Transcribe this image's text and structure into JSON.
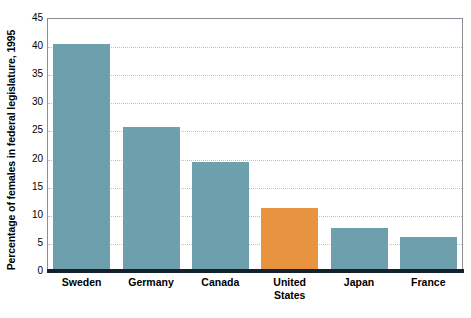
{
  "chart_data": {
    "type": "bar",
    "title": "",
    "subtitle": "",
    "xlabel": "",
    "ylabel": "Percentage of females in federal legislature, 1995",
    "categories": [
      "Sweden",
      "Germany",
      "Canada",
      "United States",
      "Japan",
      "France"
    ],
    "values": [
      40.3,
      25.7,
      19.4,
      11.2,
      7.7,
      6.1
    ],
    "ylim": [
      0,
      45
    ],
    "y_ticks": [
      0,
      5,
      10,
      15,
      20,
      25,
      30,
      35,
      40,
      45
    ],
    "y_tick_labels": [
      "0",
      "5",
      "10",
      "15",
      "20",
      "25",
      "30",
      "35",
      "40",
      "45"
    ],
    "grid": true,
    "grid_axis": "y",
    "legend": false,
    "legend_position": "none",
    "bar_colors": [
      "#6e9fac",
      "#6e9fac",
      "#6e9fac",
      "#e8933f",
      "#6e9fac",
      "#6e9fac"
    ],
    "highlight_category": "United States",
    "annotations": []
  },
  "colors": {
    "bar_default": "#6e9fac",
    "bar_highlight": "#e8933f",
    "gridline": "#b9c3c7",
    "axis_line": "#14202b",
    "plot_border": "#8a8f96",
    "text": "#000000",
    "background": "#ffffff"
  },
  "axis": {
    "y_title": "Percentage of females in federal legislature, 1995",
    "y_ticks": [
      {
        "label": "45",
        "value": 45
      },
      {
        "label": "40",
        "value": 40
      },
      {
        "label": "35",
        "value": 35
      },
      {
        "label": "30",
        "value": 30
      },
      {
        "label": "25",
        "value": 25
      },
      {
        "label": "20",
        "value": 20
      },
      {
        "label": "15",
        "value": 15
      },
      {
        "label": "10",
        "value": 10
      },
      {
        "label": "5",
        "value": 5
      },
      {
        "label": "0",
        "value": 0
      }
    ],
    "x_ticks": [
      {
        "line1": "Sweden",
        "line2": ""
      },
      {
        "line1": "Germany",
        "line2": ""
      },
      {
        "line1": "Canada",
        "line2": ""
      },
      {
        "line1": "United",
        "line2": "States"
      },
      {
        "line1": "Japan",
        "line2": ""
      },
      {
        "line1": "France",
        "line2": ""
      }
    ]
  }
}
